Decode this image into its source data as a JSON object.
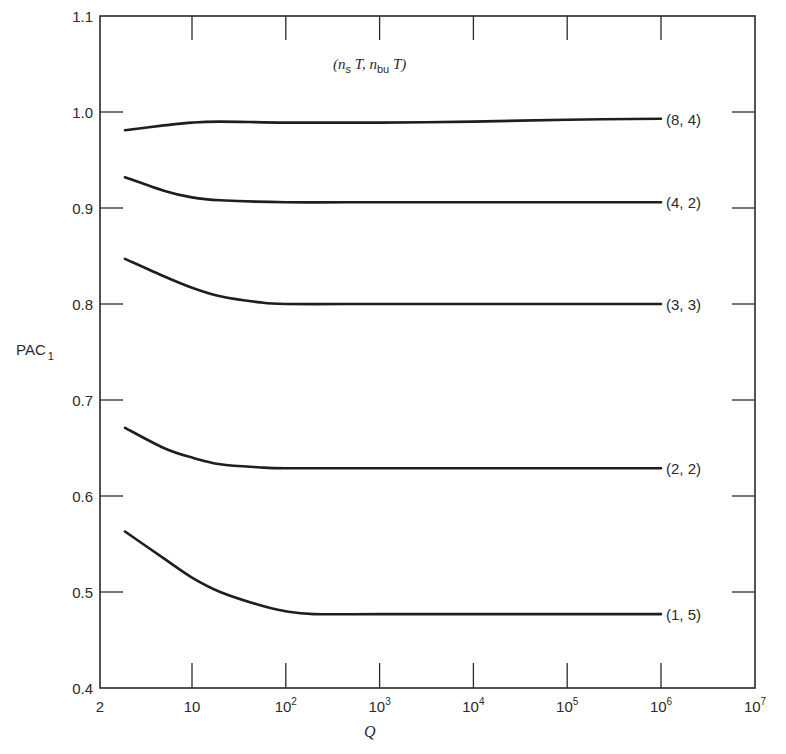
{
  "chart_data": {
    "type": "line",
    "title": "",
    "xlabel": "Q",
    "ylabel": "PAC",
    "ylabel_subscript": "1",
    "xscale": "log",
    "xlim": [
      2,
      10000000
    ],
    "ylim": [
      0.4,
      1.1
    ],
    "grid": false,
    "legend_title": {
      "prefix": "(",
      "a": "n",
      "a_sub": "s",
      "a_suffix": " T,  ",
      "b": "n",
      "b_sub": "bu",
      "b_suffix": " T)"
    },
    "x_ticks": [
      {
        "value": 2,
        "base": "2",
        "exp": ""
      },
      {
        "value": 10,
        "base": "10",
        "exp": ""
      },
      {
        "value": 100,
        "base": "10",
        "exp": "2"
      },
      {
        "value": 1000,
        "base": "10",
        "exp": "3"
      },
      {
        "value": 10000,
        "base": "10",
        "exp": "4"
      },
      {
        "value": 100000,
        "base": "10",
        "exp": "5"
      },
      {
        "value": 1000000,
        "base": "10",
        "exp": "6"
      },
      {
        "value": 10000000,
        "base": "10",
        "exp": "7"
      }
    ],
    "y_ticks": [
      {
        "value": 0.4,
        "label": "0.4"
      },
      {
        "value": 0.5,
        "label": "0.5"
      },
      {
        "value": 0.6,
        "label": "0.6"
      },
      {
        "value": 0.7,
        "label": "0.7"
      },
      {
        "value": 0.8,
        "label": "0.8"
      },
      {
        "value": 0.9,
        "label": "0.9"
      },
      {
        "value": 1.0,
        "label": "1.0"
      },
      {
        "value": 1.1,
        "label": "1.1"
      }
    ],
    "series": [
      {
        "name": "(8, 4)",
        "x": [
          2,
          5,
          10,
          20,
          100,
          1000,
          10000,
          100000,
          1000000
        ],
        "y": [
          0.981,
          0.986,
          0.989,
          0.99,
          0.989,
          0.989,
          0.99,
          0.992,
          0.993
        ]
      },
      {
        "name": "(4, 2)",
        "x": [
          2,
          5,
          10,
          20,
          100,
          1000,
          10000,
          100000,
          1000000
        ],
        "y": [
          0.932,
          0.918,
          0.911,
          0.908,
          0.906,
          0.906,
          0.906,
          0.906,
          0.906
        ]
      },
      {
        "name": "(3, 3)",
        "x": [
          2,
          5,
          10,
          20,
          50,
          100,
          1000,
          10000,
          100000,
          1000000
        ],
        "y": [
          0.847,
          0.829,
          0.817,
          0.808,
          0.802,
          0.8,
          0.8,
          0.8,
          0.8,
          0.8
        ]
      },
      {
        "name": "(2, 2)",
        "x": [
          2,
          5,
          10,
          20,
          50,
          100,
          1000,
          10000,
          100000,
          1000000
        ],
        "y": [
          0.671,
          0.65,
          0.64,
          0.633,
          0.63,
          0.629,
          0.629,
          0.629,
          0.629,
          0.629
        ]
      },
      {
        "name": "(1, 5)",
        "x": [
          2,
          5,
          10,
          20,
          50,
          100,
          200,
          1000,
          10000,
          100000,
          1000000
        ],
        "y": [
          0.563,
          0.535,
          0.515,
          0.5,
          0.487,
          0.48,
          0.477,
          0.477,
          0.477,
          0.477,
          0.477
        ]
      }
    ]
  }
}
